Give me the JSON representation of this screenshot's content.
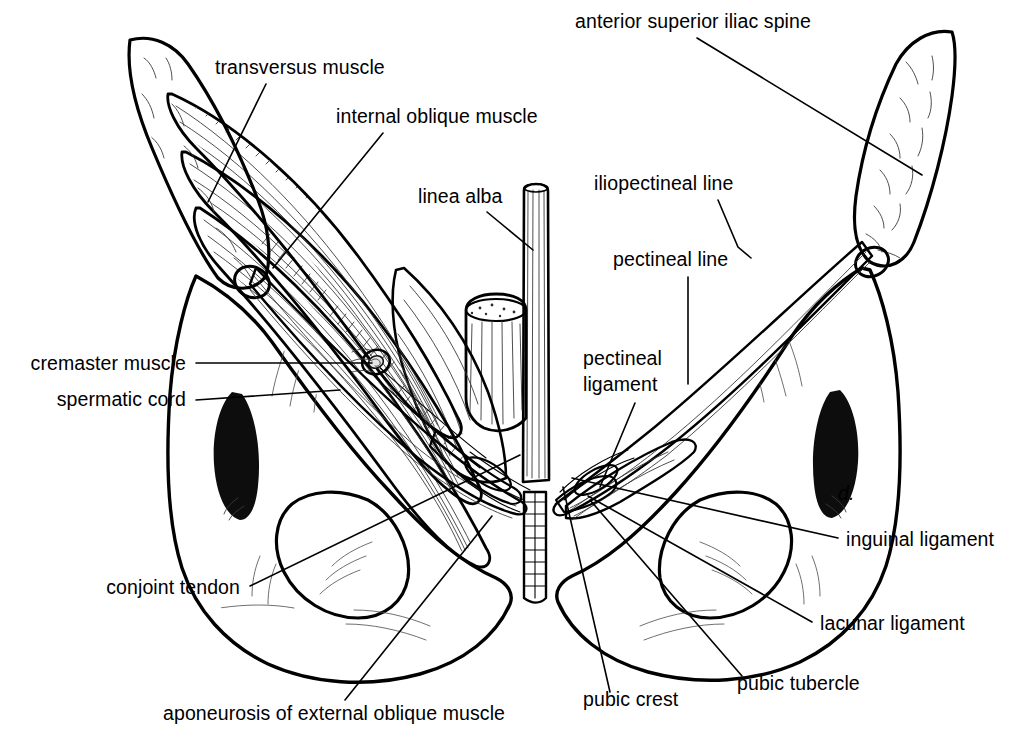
{
  "figure": {
    "background_color": "#ffffff",
    "ink_color": "#000000",
    "palette": {
      "bone_fill": "#c9c9c9",
      "bone_fill_light": "#d6d6d6",
      "muscle_mid": "#8e8e8e",
      "muscle_dark": "#6d6d6d",
      "aponeurosis_light": "#e8e8e8",
      "cavity_black": "#0d0d0d",
      "foramen_white": "#ffffff",
      "linea_alba_fill": "#7a7a7a"
    }
  },
  "labels": [
    {
      "id": "anterior-superior-iliac-spine",
      "text": "anterior superior iliac spine",
      "anchor": "start",
      "x": 575,
      "y": 28,
      "leader": "M 697 38 L 922 175"
    },
    {
      "id": "transversus-muscle",
      "text": "transversus muscle",
      "anchor": "start",
      "x": 215,
      "y": 74,
      "leader": "M 266 84 L 208 202"
    },
    {
      "id": "internal-oblique-muscle",
      "text": "internal oblique muscle",
      "anchor": "start",
      "x": 336,
      "y": 123,
      "leader": "M 383 133 L 273 268"
    },
    {
      "id": "linea-alba",
      "text": "linea alba",
      "anchor": "start",
      "x": 418,
      "y": 203,
      "leader": "M 487 212 L 533 250"
    },
    {
      "id": "iliopectineal-line",
      "text": "iliopectineal line",
      "anchor": "start",
      "x": 594,
      "y": 190,
      "leader": "M 718 200 L 738 247 L 751 258"
    },
    {
      "id": "pectineal-line",
      "text": "pectineal line",
      "anchor": "start",
      "x": 613,
      "y": 266,
      "leader": "M 688 277 L 688 384"
    },
    {
      "id": "pectineal-ligament",
      "text": "pectineal ligament",
      "anchor": "start",
      "x": 583,
      "y": 365,
      "lines": [
        "pectineal",
        "ligament"
      ],
      "leader": "M 635 403 L 600 487"
    },
    {
      "id": "cremaster-muscle",
      "text": "cremaster muscle",
      "anchor": "end",
      "x": 186,
      "y": 370,
      "leader": "M 196 363 L 372 363"
    },
    {
      "id": "spermatic-cord",
      "text": "spermatic cord",
      "anchor": "end",
      "x": 186,
      "y": 406,
      "leader": "M 196 400 L 340 390"
    },
    {
      "id": "inguinal-ligament",
      "text": "inguinal ligament",
      "anchor": "start",
      "x": 846,
      "y": 546,
      "leader": "M 838 538 L 572 478"
    },
    {
      "id": "lacunar-ligament",
      "text": "lacunar ligament",
      "anchor": "start",
      "x": 820,
      "y": 630,
      "leader": "M 812 622 L 588 496"
    },
    {
      "id": "conjoint-tendon",
      "text": "conjoint tendon",
      "anchor": "end",
      "x": 240,
      "y": 594,
      "leader": "M 250 586 L 520 455"
    },
    {
      "id": "aponeurosis-of-external-oblique-muscle",
      "text": "aponeurosis of external oblique muscle",
      "anchor": "start",
      "x": 163,
      "y": 720,
      "leader": "M 345 700 L 492 516"
    },
    {
      "id": "pubic-crest",
      "text": "pubic crest",
      "anchor": "start",
      "x": 583,
      "y": 706,
      "leader": "M 610 692 L 563 487"
    },
    {
      "id": "pubic-tubercle",
      "text": "pubic tubercle",
      "anchor": "start",
      "x": 737,
      "y": 690,
      "leader": "M 742 676 L 590 500"
    }
  ],
  "structures": [
    {
      "id": "iliac-crest-left",
      "name": "left iliac crest"
    },
    {
      "id": "iliac-crest-right",
      "name": "right iliac crest"
    },
    {
      "id": "transversus-muscle-body",
      "name": "transversus abdominis muscle"
    },
    {
      "id": "internal-oblique-body",
      "name": "internal oblique muscle"
    },
    {
      "id": "aponeurosis-sheet",
      "name": "aponeurosis of external oblique muscle"
    },
    {
      "id": "linea-alba-strip",
      "name": "linea alba"
    },
    {
      "id": "rectus-stump",
      "name": "cut rectus abdominis stump"
    },
    {
      "id": "spermatic-cord-ring",
      "name": "spermatic cord in deep ring"
    },
    {
      "id": "inguinal-ligament-cord-left",
      "name": "left inguinal ligament"
    },
    {
      "id": "inguinal-ligament-cord-right",
      "name": "right inguinal ligament"
    },
    {
      "id": "pectineal-ligament-band",
      "name": "pectineal ligament"
    },
    {
      "id": "lacunar-ligament-band",
      "name": "lacunar ligament"
    },
    {
      "id": "obturator-foramen-left",
      "name": "left obturator foramen"
    },
    {
      "id": "obturator-foramen-right",
      "name": "right obturator foramen"
    },
    {
      "id": "acetabulum-left",
      "name": "left greater sciatic/acetabular shadow"
    },
    {
      "id": "acetabulum-right",
      "name": "right greater sciatic/acetabular shadow"
    },
    {
      "id": "pubic-symphysis",
      "name": "pubic symphysis"
    }
  ]
}
